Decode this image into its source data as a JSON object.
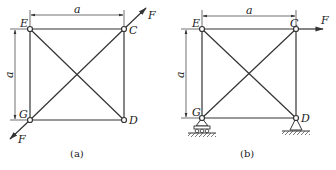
{
  "figures": [
    {
      "caption": "(a)",
      "nodes": {
        "E": "E",
        "C": "C",
        "G": "G",
        "D": "D"
      },
      "dimension_horizontal": "a",
      "dimension_vertical": "a",
      "force_top": "F",
      "force_bottom": "F",
      "supports": "none",
      "load_description": "Equal and opposite forces F along diagonal GC at nodes C and G"
    },
    {
      "caption": "(b)",
      "nodes": {
        "E": "E",
        "C": "C",
        "G": "G",
        "D": "D"
      },
      "dimension_horizontal": "a",
      "dimension_vertical": "a",
      "force": "F",
      "supports": "roller at G, pin at D",
      "load_description": "Horizontal force F at node C"
    }
  ],
  "colors": {
    "line": "#333333",
    "background": "#ffffff"
  }
}
